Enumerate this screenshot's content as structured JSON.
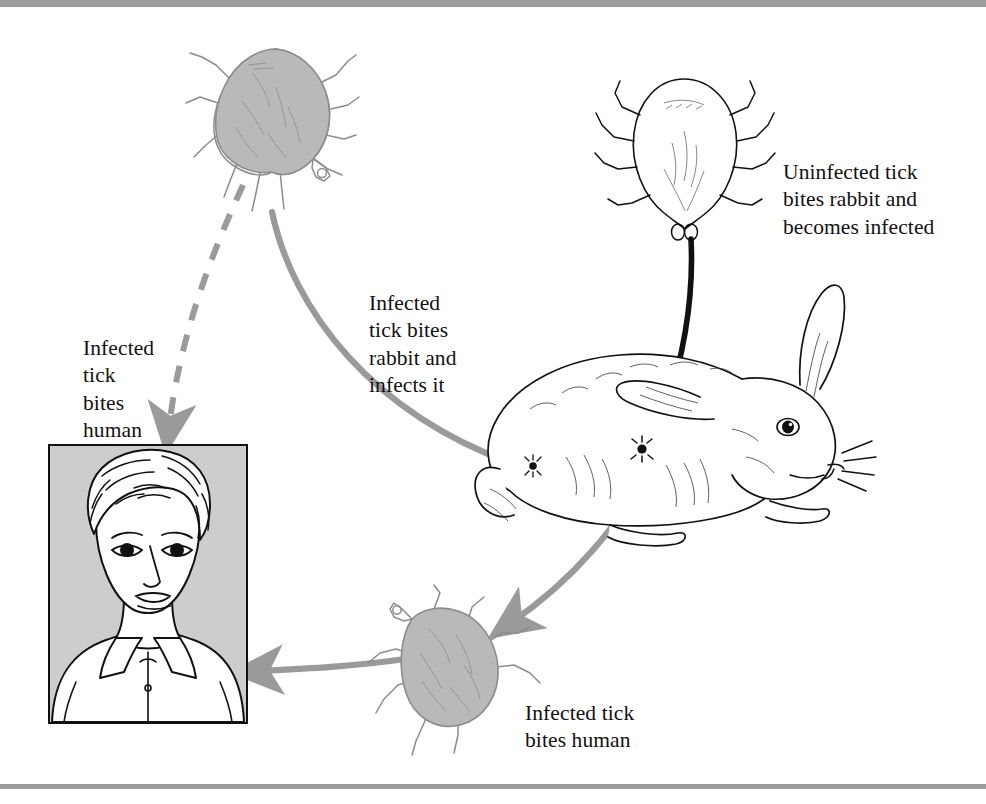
{
  "page": {
    "background_color": "#ffffff",
    "rule_color": "#9d9d9d"
  },
  "colors": {
    "arrow_gray": "#9a9a9a",
    "arrow_black": "#111111",
    "tick_infected_fill": "#b9b9b9",
    "tick_outline": "#8c8c8c",
    "human_panel_fill": "#cdcdcd",
    "ink": "#111111"
  },
  "captions": {
    "uninfected_tick": "Uninfected tick\nbites rabbit and\nbecomes infected",
    "infected_tick_rabbit": "Infected\ntick bites\nrabbit and\ninfects it",
    "infected_tick_human_left": "Infected\ntick\nbites\nhuman",
    "infected_tick_human_bottom": "Infected tick\nbites human"
  },
  "figures": {
    "tick_infected_top": "infected-tick-gray",
    "tick_uninfected": "uninfected-tick-outline",
    "rabbit": "rabbit-line-drawing",
    "tick_infected_bottom": "infected-tick-gray",
    "human": "human-portrait-framed"
  },
  "arrows": [
    {
      "name": "uninfected-tick-to-rabbit",
      "style": "solid",
      "color": "#111111",
      "from": "tick_uninfected",
      "to": "rabbit",
      "label": "uninfected_tick"
    },
    {
      "name": "infected-tick-to-rabbit",
      "style": "solid",
      "color": "#9a9a9a",
      "from": "tick_infected_top",
      "to": "rabbit",
      "label": "infected_tick_rabbit"
    },
    {
      "name": "infected-tick-to-human",
      "style": "dashed",
      "color": "#9a9a9a",
      "from": "tick_infected_top",
      "to": "human",
      "label": "infected_tick_human_left"
    },
    {
      "name": "rabbit-to-infected-tick",
      "style": "solid",
      "color": "#9a9a9a",
      "from": "rabbit",
      "to": "tick_infected_bottom",
      "label": null
    },
    {
      "name": "bottom-tick-to-human",
      "style": "solid",
      "color": "#9a9a9a",
      "from": "tick_infected_bottom",
      "to": "human",
      "label": "infected_tick_human_bottom"
    }
  ]
}
